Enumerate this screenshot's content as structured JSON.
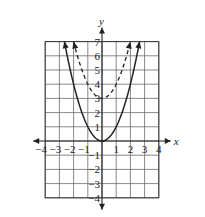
{
  "chart_data": {
    "type": "line",
    "title": "",
    "xlabel": "x",
    "ylabel": "y",
    "xlim": [
      -4,
      4
    ],
    "ylim": [
      -4,
      7
    ],
    "grid": true,
    "x_ticks": [
      -4,
      -3,
      -2,
      -1,
      1,
      2,
      3,
      4
    ],
    "x_tick_labels": [
      "−4",
      "−3",
      "−2",
      "−1",
      "1",
      "2",
      "3",
      "4"
    ],
    "y_ticks": [
      7,
      6,
      5,
      4,
      3,
      2,
      1,
      -1,
      -2,
      -3,
      -4
    ],
    "y_tick_labels": [
      "7",
      "6",
      "5",
      "4",
      "3",
      "2",
      "1",
      "−1",
      "−2",
      "−3",
      "−4"
    ],
    "series": [
      {
        "name": "y = x²",
        "style": "solid",
        "equation": "x^2",
        "x_range": [
          -2.65,
          2.65
        ],
        "arrows": "both-ends",
        "points": [
          [
            -2.65,
            7
          ],
          [
            -2,
            4
          ],
          [
            -1,
            1
          ],
          [
            0,
            0
          ],
          [
            1,
            1
          ],
          [
            2,
            4
          ],
          [
            2.65,
            7
          ]
        ]
      },
      {
        "name": "y = x² + 3",
        "style": "dashed",
        "equation": "x^2+3",
        "x_range": [
          -2,
          2
        ],
        "arrows": "both-ends",
        "points": [
          [
            -2,
            7
          ],
          [
            -1,
            4
          ],
          [
            0,
            3
          ],
          [
            1,
            4
          ],
          [
            2,
            7
          ]
        ]
      }
    ]
  }
}
